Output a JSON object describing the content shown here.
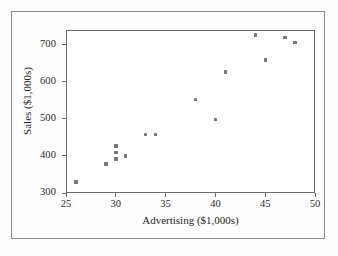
{
  "chart_data": {
    "type": "scatter",
    "title": "",
    "xlabel": "Advertising ($1,000s)",
    "ylabel": "Sales ($1,000s)",
    "xlim": [
      25,
      50
    ],
    "ylim": [
      300,
      740
    ],
    "xticks": [
      25,
      30,
      35,
      40,
      45,
      50
    ],
    "yticks": [
      300,
      400,
      500,
      600,
      700
    ],
    "xtick_labels": [
      "25",
      "30",
      "35",
      "40",
      "45",
      "50"
    ],
    "ytick_labels": [
      "300",
      "400",
      "500",
      "600",
      "700"
    ],
    "grid": false,
    "legend": null,
    "marker_color": "#77777a",
    "frame_color": "#6e6e6e",
    "x": [
      26,
      29,
      30,
      30,
      30,
      31,
      33,
      34,
      38,
      40,
      41,
      44,
      45,
      47,
      48
    ],
    "y": [
      330,
      378,
      427,
      410,
      392,
      400,
      458,
      458,
      553,
      498,
      627,
      727,
      659,
      719,
      707
    ],
    "points": [
      {
        "x": 26,
        "y": 330
      },
      {
        "x": 29,
        "y": 378
      },
      {
        "x": 30,
        "y": 427
      },
      {
        "x": 30,
        "y": 410
      },
      {
        "x": 30,
        "y": 392
      },
      {
        "x": 31,
        "y": 400
      },
      {
        "x": 33,
        "y": 458
      },
      {
        "x": 34,
        "y": 458
      },
      {
        "x": 38,
        "y": 553
      },
      {
        "x": 40,
        "y": 498
      },
      {
        "x": 41,
        "y": 627
      },
      {
        "x": 44,
        "y": 727
      },
      {
        "x": 45,
        "y": 659
      },
      {
        "x": 47,
        "y": 719
      },
      {
        "x": 48,
        "y": 707
      }
    ]
  }
}
